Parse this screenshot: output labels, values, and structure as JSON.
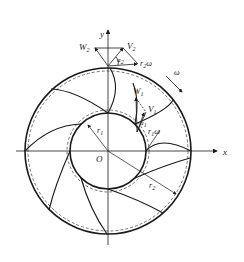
{
  "diagram": {
    "type": "impeller-velocity-triangle",
    "labels": {
      "y_axis": "y",
      "x_axis": "x",
      "origin": "O",
      "omega": "ω",
      "W2": "W",
      "W2_sub": "2",
      "V2": "V",
      "V2_sub": "2",
      "alpha2": "α",
      "alpha2_sub": "2",
      "r2omega": "r",
      "r2omega_sub": "2",
      "r2omega_tail": "ω",
      "W1": "W",
      "W1_sub": "1",
      "V1": "V",
      "V1_sub": "1",
      "alpha1": "α",
      "alpha1_sub": "1",
      "r1omega": "r",
      "r1omega_sub": "1",
      "r1omega_tail": "ω",
      "r1": "r",
      "r1_sub": "1",
      "r2": "r",
      "r2_sub": "2"
    },
    "geometry": {
      "center": [
        108,
        151
      ],
      "outer_radius": 83,
      "outer_dashed_radius": 80,
      "inner_radius": 38,
      "inner_dashed_radius": 41,
      "blade_count": 8
    },
    "colors": {
      "line": "#1a1a1a",
      "background": "#ffffff"
    }
  }
}
